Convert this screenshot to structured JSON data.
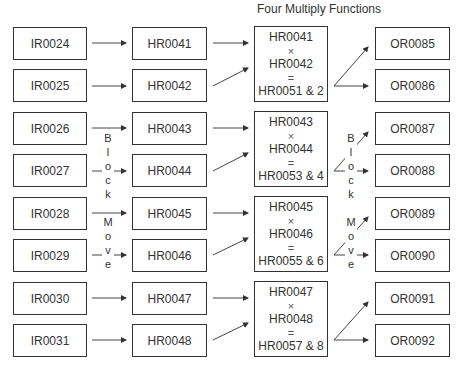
{
  "title": "Four Multiply Functions",
  "input_registers": [
    "IR0024",
    "IR0025",
    "IR0026",
    "IR0027",
    "IR0028",
    "IR0029",
    "IR0030",
    "IR0031"
  ],
  "holding_registers": [
    "HR0041",
    "HR0042",
    "HR0043",
    "HR0044",
    "HR0045",
    "HR0046",
    "HR0047",
    "HR0048"
  ],
  "multiply_blocks": [
    {
      "a": "HR0041",
      "op": "×",
      "b": "HR0042",
      "eq": "=",
      "result": "HR0051 & 2"
    },
    {
      "a": "HR0043",
      "op": "×",
      "b": "HR0044",
      "eq": "=",
      "result": "HR0053 & 4"
    },
    {
      "a": "HR0045",
      "op": "×",
      "b": "HR0046",
      "eq": "=",
      "result": "HR0055 & 6"
    },
    {
      "a": "HR0047",
      "op": "×",
      "b": "HR0048",
      "eq": "=",
      "result": "HR0057 & 8"
    }
  ],
  "output_registers": [
    "OR0085",
    "OR0086",
    "OR0087",
    "OR0088",
    "OR0089",
    "OR0090",
    "OR0091",
    "OR0092"
  ],
  "annotations": {
    "left_block": [
      "B",
      "l",
      "o",
      "c",
      "k"
    ],
    "left_move": [
      "M",
      "o",
      "v",
      "e"
    ],
    "right_block": [
      "B",
      "l",
      "o",
      "c",
      "k"
    ],
    "right_move": [
      "M",
      "o",
      "v",
      "e"
    ]
  }
}
